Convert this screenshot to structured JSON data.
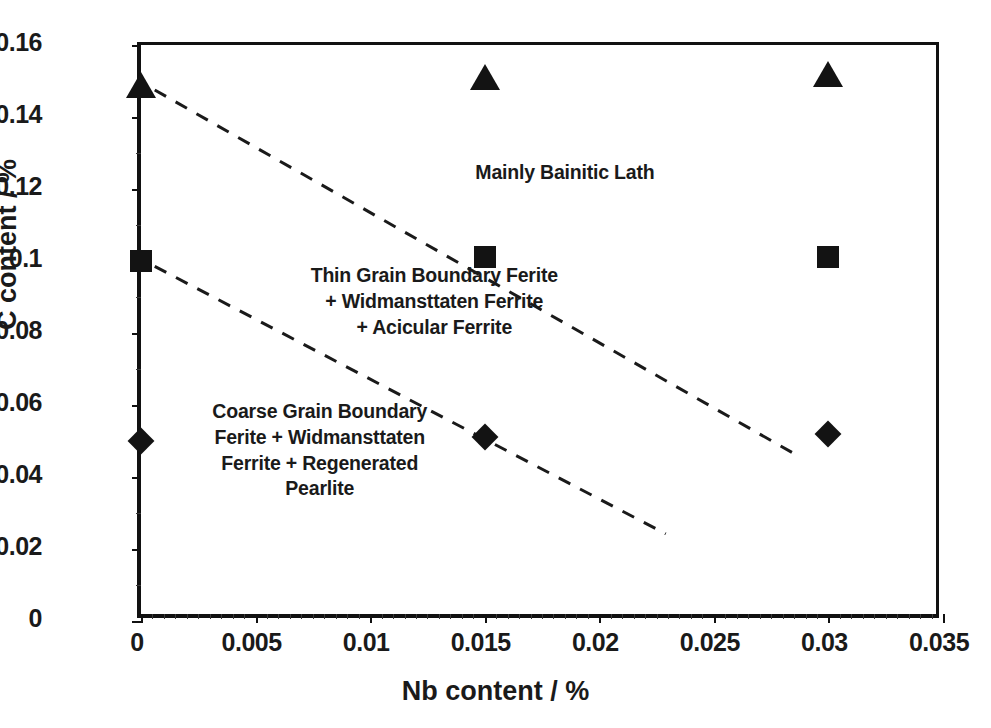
{
  "chart_data": {
    "type": "scatter",
    "title": "",
    "xlabel": "Nb content / %",
    "ylabel": "C content / %",
    "xlim": [
      0,
      0.035
    ],
    "ylim": [
      0,
      0.16
    ],
    "grid": false,
    "legend_position": "none",
    "xticks": [
      "0",
      "0.005",
      "0.01",
      "0.015",
      "0.02",
      "0.025",
      "0.03",
      "0.035"
    ],
    "xtick_values": [
      0,
      0.005,
      0.01,
      0.015,
      0.02,
      0.025,
      0.03,
      0.035
    ],
    "yticks": [
      "0",
      "0.02",
      "0.04",
      "0.06",
      "0.08",
      "0.1",
      "0.12",
      "0.14",
      "0.16"
    ],
    "ytick_values": [
      0,
      0.02,
      0.04,
      0.06,
      0.08,
      0.1,
      0.12,
      0.14,
      0.16
    ],
    "marker_color": "#131313",
    "series": [
      {
        "name": "high C (triangle)",
        "marker": "triangle",
        "points": [
          {
            "x": 0.0,
            "y": 0.149
          },
          {
            "x": 0.015,
            "y": 0.151
          },
          {
            "x": 0.03,
            "y": 0.152
          }
        ]
      },
      {
        "name": "medium C (square)",
        "marker": "square",
        "points": [
          {
            "x": 0.0,
            "y": 0.1
          },
          {
            "x": 0.015,
            "y": 0.101
          },
          {
            "x": 0.03,
            "y": 0.101
          }
        ]
      },
      {
        "name": "low C (diamond)",
        "marker": "diamond",
        "points": [
          {
            "x": 0.0,
            "y": 0.05
          },
          {
            "x": 0.015,
            "y": 0.051
          },
          {
            "x": 0.03,
            "y": 0.052
          }
        ]
      }
    ],
    "boundaries": [
      {
        "name": "upper-boundary",
        "style": "dashed",
        "points": [
          {
            "x": 0.0006,
            "y": 0.1475
          },
          {
            "x": 0.0285,
            "y": 0.0465
          }
        ]
      },
      {
        "name": "lower-boundary",
        "style": "dashed",
        "points": [
          {
            "x": 0.0006,
            "y": 0.0985
          },
          {
            "x": 0.0229,
            "y": 0.0242
          }
        ]
      }
    ],
    "annotations": [
      {
        "name": "mainly-bainitic-lath",
        "lines": [
          "Mainly Bainitic Lath"
        ],
        "x": 0.0185,
        "y": 0.1245
      },
      {
        "name": "thin-grain-boundary-ferrite",
        "lines": [
          "Thin Grain Boundary Ferite",
          "+ Widmansttaten Ferrite",
          "+ Acicular Ferrite"
        ],
        "x": 0.0128,
        "y": 0.0885
      },
      {
        "name": "coarse-grain-boundary-ferrite",
        "lines": [
          "Coarse Grain Boundary",
          "Ferite + Widmansttaten",
          "Ferrite + Regenerated",
          "Pearlite"
        ],
        "x": 0.0078,
        "y": 0.0472
      }
    ]
  },
  "figure": {
    "caption": ""
  }
}
